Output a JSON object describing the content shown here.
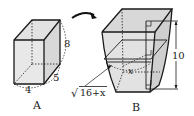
{
  "figure_a": {
    "label": "A",
    "dims": {
      "height": "8",
      "depth": "5",
      "width": "4"
    }
  },
  "figure_b": {
    "label": "B",
    "height_label": "10",
    "variable_label": "x",
    "expression_radicand": "16+x",
    "expression_radical": "√"
  },
  "colors": {
    "stroke": "#1a1a1a",
    "fill": "#e6e6e6",
    "fill_dark": "#d4d4d4"
  }
}
